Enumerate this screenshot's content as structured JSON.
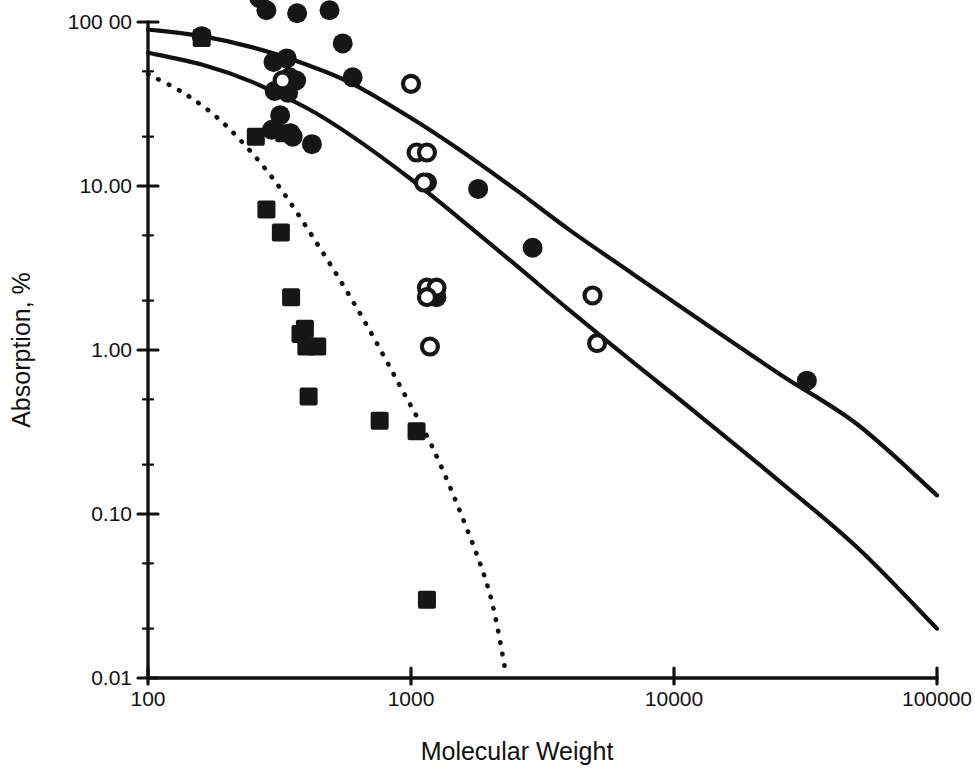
{
  "chart_data": {
    "type": "scatter",
    "title": "",
    "xlabel": "Molecular Weight",
    "ylabel": "Absorption, %",
    "xscale": "log",
    "yscale": "log",
    "xlim": [
      100,
      100000
    ],
    "ylim": [
      0.01,
      100
    ],
    "grid": false,
    "legend_position": "none",
    "xticks": [
      100,
      1000,
      10000,
      100000
    ],
    "xticklabels": [
      "100",
      "1000",
      "10000",
      "100000"
    ],
    "yticks": [
      100,
      10,
      1,
      0.1,
      0.01
    ],
    "yticklabels": [
      "100 00",
      "10.00",
      "1.00",
      "0.10",
      "0.01"
    ],
    "series": [
      {
        "name": "filled-circle",
        "marker": "filled-circle",
        "points": [
          [
            160,
            82
          ],
          [
            265,
            140
          ],
          [
            282,
            118
          ],
          [
            296,
            22
          ],
          [
            300,
            57
          ],
          [
            303,
            38
          ],
          [
            318,
            27
          ],
          [
            337,
            60
          ],
          [
            341,
            37
          ],
          [
            345,
            46
          ],
          [
            348,
            21
          ],
          [
            355,
            20
          ],
          [
            366,
            44
          ],
          [
            369,
            113
          ],
          [
            420,
            18
          ],
          [
            490,
            118
          ],
          [
            550,
            74
          ],
          [
            600,
            46
          ],
          [
            1150,
            10.5
          ],
          [
            1250,
            2.1
          ],
          [
            1800,
            9.6
          ],
          [
            2900,
            4.2
          ],
          [
            32000,
            0.65
          ]
        ]
      },
      {
        "name": "open-circle",
        "marker": "open-circle",
        "points": [
          [
            325,
            44
          ],
          [
            1000,
            42
          ],
          [
            1050,
            16
          ],
          [
            1150,
            16
          ],
          [
            1120,
            10.5
          ],
          [
            1150,
            2.4
          ],
          [
            1250,
            2.4
          ],
          [
            1150,
            2.1
          ],
          [
            1180,
            1.05
          ],
          [
            4900,
            2.15
          ],
          [
            5100,
            1.1
          ]
        ]
      },
      {
        "name": "filled-square",
        "marker": "filled-square",
        "points": [
          [
            160,
            80
          ],
          [
            257,
            20
          ],
          [
            282,
            7.2
          ],
          [
            320,
            5.2
          ],
          [
            330,
            21
          ],
          [
            350,
            2.1
          ],
          [
            380,
            1.25
          ],
          [
            395,
            1.35
          ],
          [
            400,
            1.05
          ],
          [
            440,
            1.05
          ],
          [
            408,
            0.52
          ],
          [
            760,
            0.37
          ],
          [
            1050,
            0.32
          ],
          [
            1150,
            0.03
          ]
        ]
      }
    ],
    "curves": [
      {
        "name": "upper-solid-curve",
        "style": "solid",
        "points": [
          [
            100,
            90
          ],
          [
            160,
            82
          ],
          [
            250,
            70
          ],
          [
            400,
            55
          ],
          [
            600,
            42
          ],
          [
            1000,
            26
          ],
          [
            1500,
            17
          ],
          [
            2500,
            9.5
          ],
          [
            4000,
            5.4
          ],
          [
            7000,
            2.9
          ],
          [
            12000,
            1.6
          ],
          [
            25000,
            0.72
          ],
          [
            50000,
            0.35
          ],
          [
            100000,
            0.13
          ]
        ]
      },
      {
        "name": "middle-solid-curve",
        "style": "solid",
        "points": [
          [
            100,
            65
          ],
          [
            160,
            55
          ],
          [
            250,
            43
          ],
          [
            400,
            30
          ],
          [
            600,
            20
          ],
          [
            1000,
            11
          ],
          [
            1500,
            6.5
          ],
          [
            2500,
            3.3
          ],
          [
            4000,
            1.75
          ],
          [
            7000,
            0.84
          ],
          [
            12000,
            0.42
          ],
          [
            25000,
            0.16
          ],
          [
            50000,
            0.062
          ],
          [
            100000,
            0.02
          ]
        ]
      },
      {
        "name": "lower-dotted-curve",
        "style": "dotted",
        "points": [
          [
            100,
            48
          ],
          [
            140,
            36
          ],
          [
            200,
            23
          ],
          [
            300,
            11
          ],
          [
            450,
            4.2
          ],
          [
            650,
            1.6
          ],
          [
            900,
            0.62
          ],
          [
            1200,
            0.26
          ],
          [
            1600,
            0.088
          ],
          [
            2000,
            0.032
          ],
          [
            2300,
            0.0105
          ]
        ]
      }
    ]
  },
  "axes": {
    "x_tick_labels": [
      "100",
      "1000",
      "10000",
      "100000"
    ],
    "y_tick_labels": [
      "100 00",
      "10.00",
      "1.00",
      "0.10",
      "0.01"
    ],
    "x_axis_title": "Molecular Weight",
    "y_axis_title": "Absorption, %"
  },
  "colors": {
    "ink": "#111111",
    "background": "#ffffff",
    "marker_fill": "#161616"
  }
}
